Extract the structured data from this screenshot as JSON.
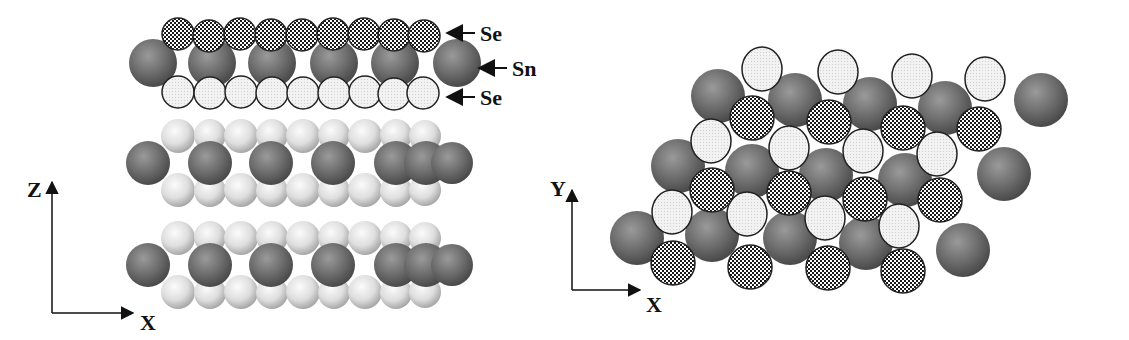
{
  "figure": {
    "colors": {
      "sn_atom": "#6e6e6e",
      "se_top_atom_pattern": "checkered",
      "se_bottom_atom": "#ececec",
      "outline": "#222222",
      "background": "#ffffff"
    },
    "side_view": {
      "labels": [
        {
          "text": "Se",
          "target": "top Se layer"
        },
        {
          "text": "Sn",
          "target": "Sn layer"
        },
        {
          "text": "Se",
          "target": "bottom Se layer"
        }
      ],
      "axes": {
        "vertical": "Z",
        "horizontal": "X"
      },
      "layer_count": 3
    },
    "top_view": {
      "axes": {
        "vertical": "Y",
        "horizontal": "X"
      }
    }
  }
}
